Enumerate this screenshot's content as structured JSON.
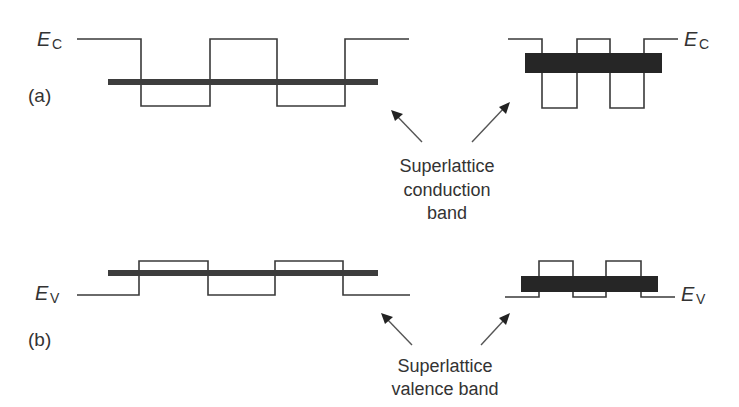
{
  "figure": {
    "panels": [
      {
        "id": "a",
        "label": "(a)",
        "band_edge": {
          "symbol": "E",
          "subscript": "C"
        }
      },
      {
        "id": "b",
        "label": "(b)",
        "band_edge": {
          "symbol": "E",
          "subscript": "V"
        }
      }
    ],
    "annotations": {
      "conduction": [
        "Superlattice",
        "conduction",
        "band"
      ],
      "valence": [
        "Superlattice",
        "valence band"
      ]
    },
    "colors": {
      "line": "#3a3a3a",
      "band": "#262626",
      "text": "#333333",
      "background": "#ffffff"
    }
  }
}
